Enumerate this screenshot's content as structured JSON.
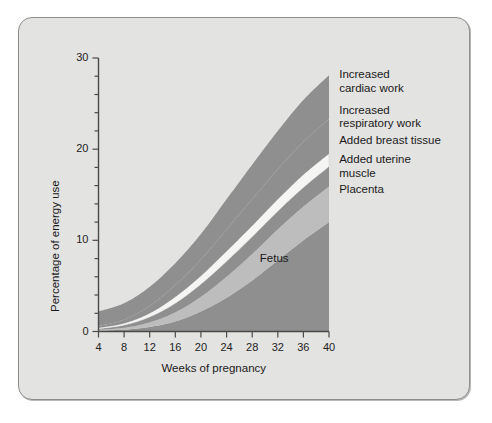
{
  "figure": {
    "background_color": "#e3e3e1",
    "frame_border_color": "#8e8e8e"
  },
  "chart_data": {
    "type": "area",
    "title": "",
    "subtitle": "",
    "xlabel": "Weeks of pregnancy",
    "ylabel": "Percentage of energy use",
    "xlim": [
      4,
      40
    ],
    "ylim": [
      0,
      30
    ],
    "xticks": [
      4,
      8,
      12,
      16,
      20,
      24,
      28,
      32,
      36,
      40
    ],
    "yticks": [
      0,
      10,
      20,
      30
    ],
    "y_minor_tick_interval": 2,
    "grid": false,
    "legend_position": "right-inline",
    "stacked": true,
    "x": [
      4,
      8,
      12,
      16,
      20,
      24,
      28,
      32,
      36,
      40
    ],
    "series": [
      {
        "name": "Fetus",
        "label": "Fetus",
        "color": "#8f8f8f",
        "values": [
          0.1,
          0.2,
          0.5,
          1.1,
          2.2,
          3.7,
          5.6,
          7.8,
          10.0,
          12.0
        ],
        "label_x": 29.2,
        "label_y": 8.0
      },
      {
        "name": "Placenta",
        "label": "Placenta",
        "color": "#bdbdbd",
        "values": [
          0.1,
          0.2,
          0.5,
          1.0,
          1.6,
          2.3,
          2.9,
          3.4,
          3.7,
          3.9
        ],
        "label_x": 41.6,
        "label_y": 15.5
      },
      {
        "name": "Added uterine muscle",
        "label": "Added uterine\nmuscle",
        "color": "#8f8f8f",
        "values": [
          0.1,
          0.3,
          0.6,
          1.0,
          1.4,
          1.7,
          1.9,
          2.0,
          2.1,
          2.2
        ],
        "label_x": 41.6,
        "label_y": 18.8
      },
      {
        "name": "Added breast tissue",
        "label": "Added breast  tissue",
        "color": "#f5f5f3",
        "values": [
          0.1,
          0.2,
          0.4,
          0.7,
          0.9,
          1.1,
          1.2,
          1.3,
          1.4,
          1.4
        ],
        "label_x": 41.6,
        "label_y": 20.9
      },
      {
        "name": "Increased respiratory work",
        "label": "Increased\nrespiratory work",
        "color": "#8f8f8f",
        "values": [
          0.2,
          0.4,
          0.8,
          1.3,
          1.8,
          2.4,
          2.9,
          3.3,
          3.6,
          3.8
        ],
        "label_x": 41.6,
        "label_y": 24.2
      },
      {
        "name": "Increased cardiac work",
        "label": "Increased\ncardiac work",
        "color": "#8f8f8f",
        "values": [
          1.6,
          1.8,
          2.1,
          2.4,
          2.8,
          3.3,
          3.8,
          4.2,
          4.6,
          4.8
        ],
        "label_x": 41.6,
        "label_y": 28.1
      }
    ],
    "total_at_40_weeks": 28.1
  }
}
